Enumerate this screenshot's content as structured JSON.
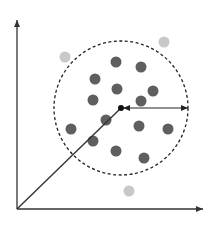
{
  "diagram": {
    "type": "scatter-with-radius-circle",
    "colors": {
      "axis": "#333333",
      "inlier": "#5f5f5f",
      "outlier": "#c8c8c8",
      "circle": "#222222",
      "center": "#111111",
      "vector": "#333333",
      "radius_arrow": "#222222"
    },
    "axes": {
      "origin": [
        17,
        209
      ],
      "y_end": [
        17,
        20
      ],
      "x_end": [
        203,
        209
      ]
    },
    "circle": {
      "cx": 121,
      "cy": 108,
      "r": 67
    },
    "center_point": [
      121,
      108
    ],
    "vector_from_origin": {
      "from": [
        17,
        209
      ],
      "to": [
        121,
        108
      ]
    },
    "radius_arrow": {
      "from": [
        123,
        108
      ],
      "to": [
        188,
        108
      ]
    },
    "inlier_points": [
      [
        116,
        62
      ],
      [
        141,
        67
      ],
      [
        95,
        79
      ],
      [
        117,
        89
      ],
      [
        153,
        91
      ],
      [
        93,
        100
      ],
      [
        141,
        101
      ],
      [
        106,
        120
      ],
      [
        71,
        129
      ],
      [
        139,
        126
      ],
      [
        168,
        129
      ],
      [
        93,
        141
      ],
      [
        116,
        151
      ],
      [
        144,
        158
      ]
    ],
    "outlier_points": [
      [
        65,
        57
      ],
      [
        164,
        42
      ],
      [
        129,
        191
      ]
    ],
    "dot_radius": 5.5
  }
}
